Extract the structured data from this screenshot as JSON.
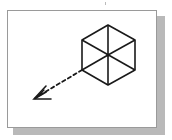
{
  "figure": {
    "colors": {
      "stroke": "#1a1a1a",
      "frame_border": "#9a9a9a",
      "shadow": "#b9b9b9",
      "background": "#ffffff"
    },
    "cube": {
      "center": [
        108,
        55
      ],
      "vertices": [
        [
          108,
          25
        ],
        [
          135,
          40
        ],
        [
          135,
          70
        ],
        [
          108,
          85
        ],
        [
          82,
          70
        ],
        [
          82,
          40
        ]
      ]
    },
    "arrow": {
      "from": [
        103,
        58
      ],
      "to": [
        34,
        99
      ],
      "style": "dashed"
    }
  }
}
